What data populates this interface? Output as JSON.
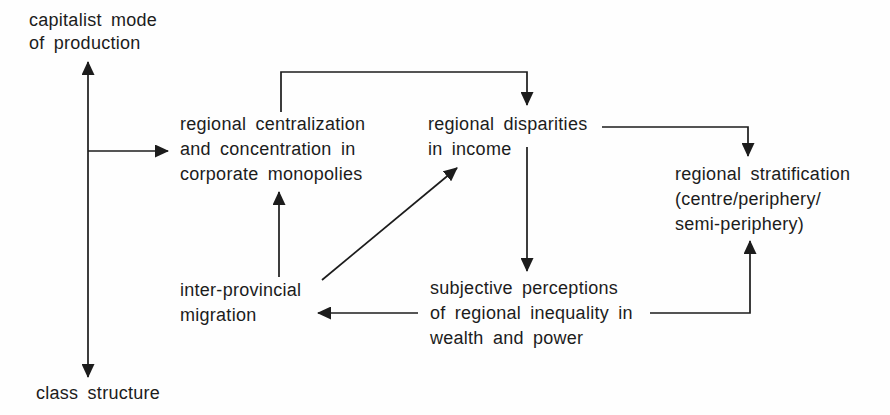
{
  "figure": {
    "background": "#fefefe",
    "ink": "#1c1c1c"
  },
  "nodes": {
    "capitalist_mode": {
      "lines": [
        "capitalist mode",
        "of production"
      ]
    },
    "class_structure": {
      "lines": [
        "class structure"
      ]
    },
    "regional_centralization": {
      "lines": [
        "regional centralization",
        "and concentration in",
        "corporate monopolies"
      ]
    },
    "regional_disparities": {
      "lines": [
        "regional disparities",
        "in income"
      ]
    },
    "regional_stratification": {
      "lines": [
        "regional stratification",
        "(centre/periphery/",
        "semi-periphery)"
      ]
    },
    "inter_provincial_migration": {
      "lines": [
        "inter-provincial",
        "migration"
      ]
    },
    "subjective_perceptions": {
      "lines": [
        "subjective perceptions",
        "of regional inequality in",
        "wealth and power"
      ]
    }
  },
  "edges": [
    {
      "from": "capitalist_mode",
      "to": "class_structure",
      "arrows": "both"
    },
    {
      "from": "capitalist_mode_class_structure_axis",
      "to": "regional_centralization",
      "arrows": "end"
    },
    {
      "from": "regional_centralization",
      "to": "regional_disparities",
      "arrows": "end"
    },
    {
      "from": "regional_disparities",
      "to": "regional_stratification",
      "arrows": "end"
    },
    {
      "from": "regional_disparities",
      "to": "subjective_perceptions",
      "arrows": "end"
    },
    {
      "from": "subjective_perceptions",
      "to": "inter_provincial_migration",
      "arrows": "end"
    },
    {
      "from": "inter_provincial_migration",
      "to": "regional_disparities",
      "arrows": "end"
    },
    {
      "from": "inter_provincial_migration",
      "to": "regional_centralization",
      "arrows": "end"
    },
    {
      "from": "subjective_perceptions",
      "to": "regional_stratification",
      "arrows": "end"
    }
  ]
}
